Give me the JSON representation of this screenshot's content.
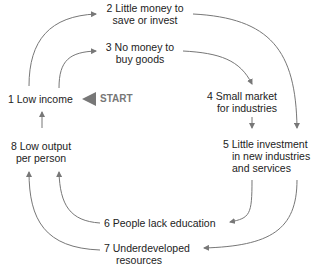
{
  "diagram": {
    "type": "cycle",
    "nodes": [
      {
        "id": 1,
        "line1": "1 Low income",
        "line2": ""
      },
      {
        "id": 2,
        "line1": "2 Little money to",
        "line2": "save or invest"
      },
      {
        "id": 3,
        "line1": "3 No money to",
        "line2": "buy goods"
      },
      {
        "id": 4,
        "line1": "4 Small market",
        "line2": "for industries"
      },
      {
        "id": 5,
        "line1": "5 Little investment",
        "line2": "in new industries",
        "line3": "and services"
      },
      {
        "id": 6,
        "line1": "6 People lack education",
        "line2": ""
      },
      {
        "id": 7,
        "line1": "7 Underdeveloped",
        "line2": "resources"
      },
      {
        "id": 8,
        "line1": "8 Low output",
        "line2": "per person"
      }
    ],
    "start_label": "START",
    "colors": {
      "arrow": "#777777",
      "text": "#222222",
      "start": "#777777"
    }
  }
}
